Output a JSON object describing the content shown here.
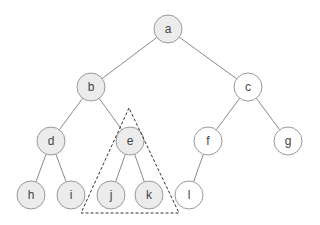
{
  "diagram": {
    "type": "binary-tree",
    "node_radius": 14,
    "colors": {
      "shaded_fill": "#ececec",
      "plain_fill": "#ffffff",
      "stroke": "#9a9a9a",
      "edge": "#8a8a8a",
      "triangle": "#333333",
      "text": "#444444"
    },
    "nodes": [
      {
        "id": "a",
        "label": "a",
        "x": 168,
        "y": 29,
        "shaded": true
      },
      {
        "id": "b",
        "label": "b",
        "x": 91,
        "y": 87,
        "shaded": true
      },
      {
        "id": "c",
        "label": "c",
        "x": 248,
        "y": 87,
        "shaded": false
      },
      {
        "id": "d",
        "label": "d",
        "x": 51,
        "y": 141,
        "shaded": true
      },
      {
        "id": "e",
        "label": "e",
        "x": 130,
        "y": 141,
        "shaded": true
      },
      {
        "id": "f",
        "label": "f",
        "x": 208,
        "y": 141,
        "shaded": false
      },
      {
        "id": "g",
        "label": "g",
        "x": 288,
        "y": 141,
        "shaded": false
      },
      {
        "id": "h",
        "label": "h",
        "x": 31,
        "y": 195,
        "shaded": true
      },
      {
        "id": "i",
        "label": "i",
        "x": 71,
        "y": 195,
        "shaded": true
      },
      {
        "id": "j",
        "label": "j",
        "x": 111,
        "y": 195,
        "shaded": true
      },
      {
        "id": "k",
        "label": "k",
        "x": 149,
        "y": 195,
        "shaded": true
      },
      {
        "id": "l",
        "label": "l",
        "x": 189,
        "y": 195,
        "shaded": false
      }
    ],
    "edges": [
      [
        "a",
        "b"
      ],
      [
        "a",
        "c"
      ],
      [
        "b",
        "d"
      ],
      [
        "b",
        "e"
      ],
      [
        "c",
        "f"
      ],
      [
        "c",
        "g"
      ],
      [
        "d",
        "h"
      ],
      [
        "d",
        "i"
      ],
      [
        "e",
        "j"
      ],
      [
        "e",
        "k"
      ],
      [
        "f",
        "l"
      ]
    ],
    "subtree_triangle": {
      "root": "e",
      "points": [
        [
          129,
          108
        ],
        [
          81,
          213
        ],
        [
          179,
          213
        ]
      ],
      "style": "dashed"
    }
  }
}
